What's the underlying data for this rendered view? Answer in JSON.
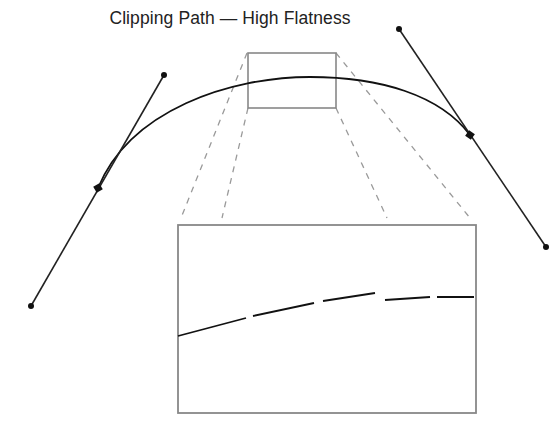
{
  "title": "Clipping Path — High Flatness",
  "colors": {
    "curve": "#111111",
    "handle": "#222222",
    "box": "#888888",
    "dash": "#9a9a9a",
    "background": "#ffffff"
  },
  "diagram": {
    "curve": {
      "start_anchor": [
        98,
        188
      ],
      "end_anchor": [
        470,
        135
      ],
      "control_1": [
        164,
        75
      ],
      "control_2": [
        399,
        29
      ]
    },
    "left_handle": {
      "from": [
        31,
        306
      ],
      "anchor": [
        98,
        188
      ],
      "to": [
        164,
        75
      ]
    },
    "right_handle": {
      "from": [
        399,
        29
      ],
      "anchor": [
        470,
        135
      ],
      "to": [
        546,
        247
      ]
    },
    "zoom_region": {
      "x": 248,
      "y": 53,
      "width": 88,
      "height": 55
    },
    "inset": {
      "x": 178,
      "y": 225,
      "width": 298,
      "height": 188
    },
    "inset_segments": [
      [
        [
          178,
          336
        ],
        [
          246,
          318
        ]
      ],
      [
        [
          253,
          316
        ],
        [
          314,
          303
        ]
      ],
      [
        [
          323,
          301
        ],
        [
          375,
          293
        ]
      ],
      [
        [
          385,
          291
        ],
        [
          430,
          297
        ]
      ],
      [
        [
          437,
          296
        ],
        [
          474,
          296
        ]
      ]
    ]
  }
}
